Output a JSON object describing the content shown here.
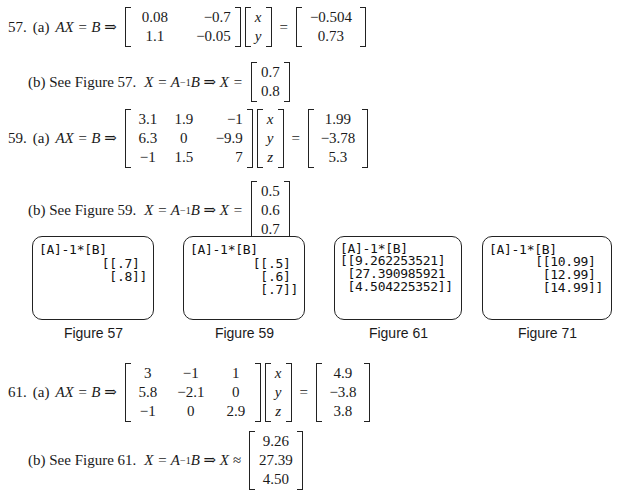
{
  "problems": [
    {
      "number": "57.",
      "part_a": {
        "label": "(a)",
        "lhs": "AX = B ⇒",
        "matrix_A": [
          [
            "0.08",
            "−0.7"
          ],
          [
            "1.1",
            "−0.05"
          ]
        ],
        "vector_X": [
          "x",
          "y"
        ],
        "equals": "=",
        "vector_B": [
          "−0.504",
          "0.73"
        ]
      },
      "part_b": {
        "label": "(b) See Figure 57.",
        "eq_prefix": "X = A",
        "inv": "−1",
        "eq_suffix": "B ⇒ X =",
        "result": [
          "0.7",
          "0.8"
        ]
      }
    },
    {
      "number": "59.",
      "part_a": {
        "label": "(a)",
        "lhs": "AX = B ⇒",
        "matrix_A": [
          [
            "3.1",
            "1.9",
            "−1"
          ],
          [
            "6.3",
            "0",
            "−9.9"
          ],
          [
            "−1",
            "1.5",
            "7"
          ]
        ],
        "vector_X": [
          "x",
          "y",
          "z"
        ],
        "equals": "=",
        "vector_B": [
          "1.99",
          "−3.78",
          "5.3"
        ]
      },
      "part_b": {
        "label": "(b) See Figure 59.",
        "eq_prefix": "X = A",
        "inv": "−1",
        "eq_suffix": "B ⇒ X =",
        "result": [
          "0.5",
          "0.6",
          "0.7"
        ]
      }
    },
    {
      "number": "61.",
      "part_a": {
        "label": "(a)",
        "lhs": "AX = B ⇒",
        "matrix_A": [
          [
            "3",
            "−1",
            "1"
          ],
          [
            "5.8",
            "−2.1",
            "0"
          ],
          [
            "−1",
            "0",
            "2.9"
          ]
        ],
        "vector_X": [
          "x",
          "y",
          "z"
        ],
        "equals": "=",
        "vector_B": [
          "4.9",
          "−3.8",
          "3.8"
        ]
      },
      "part_b": {
        "label": "(b) See Figure 61.",
        "eq_prefix": "X = A",
        "inv": "−1",
        "eq_suffix": "B ⇒ X ≈",
        "result": [
          "9.26",
          "27.39",
          "4.50"
        ]
      }
    }
  ],
  "figures": [
    {
      "caption": "Figure 57",
      "command": "[A]-1*[B]",
      "lines": [
        "[[.7]",
        " [.8]]"
      ]
    },
    {
      "caption": "Figure 59",
      "command": "[A]-1*[B]",
      "lines": [
        "[[.5]",
        " [.6]",
        " [.7]]"
      ]
    },
    {
      "caption": "Figure 61",
      "command": "[A]-1*[B]",
      "lines": [
        "[[9.262253521]",
        " [27.390985921",
        " [4.504225352]]"
      ]
    },
    {
      "caption": "Figure 71",
      "command": "[A]-1*[B]",
      "lines": [
        "[[10.99]",
        " [12.99]",
        " [14.99]]"
      ]
    }
  ]
}
